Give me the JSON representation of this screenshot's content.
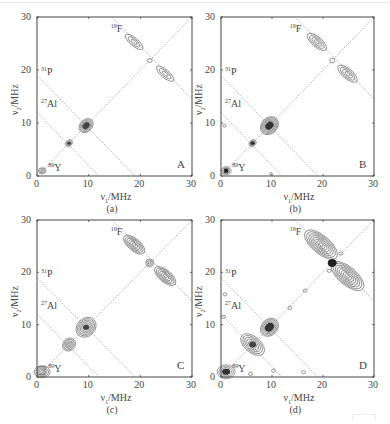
{
  "figure": {
    "panels": [
      {
        "id": "a",
        "letter": "A",
        "caption": "(a)",
        "xlabel": "ν1/MHz",
        "ylabel": "ν2/MHz",
        "xticks": [
          "0",
          "10",
          "20",
          "30"
        ],
        "yticks": [
          "0",
          "10",
          "20",
          "30"
        ],
        "nuclei": [
          {
            "mass": "19",
            "symbol": "F"
          },
          {
            "mass": "31",
            "symbol": "P"
          },
          {
            "mass": "27",
            "symbol": "Al"
          },
          {
            "mass": "89",
            "symbol": "Y"
          }
        ]
      },
      {
        "id": "b",
        "letter": "B",
        "caption": "(b)",
        "xlabel": "ν1/MHz",
        "ylabel": "ν2/MHz",
        "xticks": [
          "0",
          "10",
          "20",
          "30"
        ],
        "yticks": [
          "0",
          "10",
          "20",
          "30"
        ],
        "nuclei": [
          {
            "mass": "19",
            "symbol": "F"
          },
          {
            "mass": "31",
            "symbol": "P"
          },
          {
            "mass": "27",
            "symbol": "Al"
          },
          {
            "mass": "89",
            "symbol": "Y"
          }
        ]
      },
      {
        "id": "c",
        "letter": "C",
        "caption": "(c)",
        "xlabel": "ν1/MHz",
        "ylabel": "ν2/MHz",
        "xticks": [
          "0",
          "10",
          "20",
          "30"
        ],
        "yticks": [
          "0",
          "10",
          "20",
          "30"
        ],
        "nuclei": [
          {
            "mass": "19",
            "symbol": "F"
          },
          {
            "mass": "31",
            "symbol": "P"
          },
          {
            "mass": "27",
            "symbol": "Al"
          },
          {
            "mass": "89",
            "symbol": "Y"
          }
        ]
      },
      {
        "id": "d",
        "letter": "D",
        "caption": "(d)",
        "xlabel": "ν1/MHz",
        "ylabel": "ν2/MHz",
        "xticks": [
          "0",
          "10",
          "20",
          "30"
        ],
        "yticks": [
          "0",
          "10",
          "20",
          "30"
        ],
        "nuclei": [
          {
            "mass": "19",
            "symbol": "F"
          },
          {
            "mass": "31",
            "symbol": "P"
          },
          {
            "mass": "27",
            "symbol": "Al"
          },
          {
            "mass": "89",
            "symbol": "Y"
          }
        ]
      }
    ],
    "axis_range_mhz": [
      0,
      30
    ],
    "antidiagonal_lines_mhz": {
      "F19": 28.6,
      "P31": 19.0,
      "Al27": 12.0
    },
    "peaks_mhz": {
      "Y89": [
        1.0,
        1.0
      ],
      "Al27": [
        6.2,
        6.2
      ],
      "P31": [
        9.5,
        9.5
      ],
      "F19_diag": [
        21.8,
        21.8
      ],
      "F19_cross": [
        [
          18.8,
          25.3
        ],
        [
          24.8,
          19.3
        ]
      ]
    },
    "colors": {
      "contour": "#555555",
      "frame": "#333333",
      "guide": "#777777"
    }
  }
}
